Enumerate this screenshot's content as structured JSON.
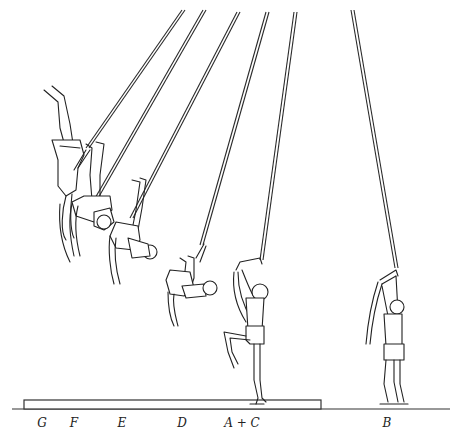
{
  "figure": {
    "colors": {
      "ink": "#222222",
      "background": "#ffffff"
    }
  },
  "labels": [
    {
      "id": "G",
      "text": "G",
      "x": 42,
      "y": 416
    },
    {
      "id": "F",
      "text": "F",
      "x": 74,
      "y": 416
    },
    {
      "id": "E",
      "text": "E",
      "x": 122,
      "y": 416
    },
    {
      "id": "D",
      "text": "D",
      "x": 182,
      "y": 416
    },
    {
      "id": "AC",
      "text": "A + C",
      "x": 242,
      "y": 416
    },
    {
      "id": "B",
      "text": "B",
      "x": 387,
      "y": 416
    }
  ],
  "mat": {
    "x1": 24,
    "x2": 321,
    "top": 400,
    "bottom": 409
  },
  "ground": {
    "x1": 12,
    "x2": 450,
    "y": 409
  }
}
